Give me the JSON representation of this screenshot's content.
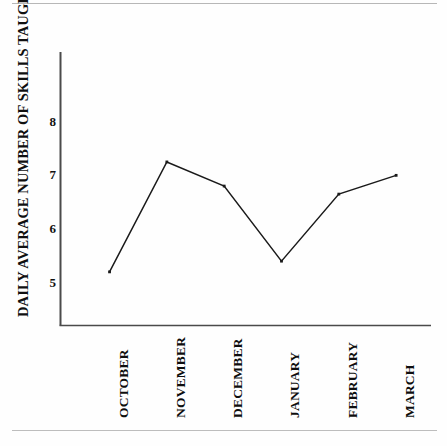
{
  "figure": {
    "name": "line-chart-daily-average-skills-taught",
    "background_color": "#fefefe",
    "line_color": "#1a1a1a",
    "axis_color": "#4a4a4a",
    "rule_color": "#b7b7b7"
  },
  "chart_data": {
    "type": "line",
    "title": "",
    "subtitle": "",
    "xlabel": "",
    "ylabel": "DAILY AVERAGE NUMBER OF SKILLS TAUGHT",
    "categories": [
      "OCTOBER",
      "NOVEMBER",
      "DECEMBER",
      "JANUARY",
      "FEBRUARY",
      "MARCH"
    ],
    "values": [
      5.2,
      7.25,
      6.8,
      5.4,
      6.65,
      7.0
    ],
    "series": [
      {
        "name": "Daily average number of skills taught",
        "values": [
          5.2,
          7.25,
          6.8,
          5.4,
          6.65,
          7.0
        ]
      }
    ],
    "ytick_labels": [
      "8",
      "7",
      "6",
      "5"
    ],
    "ytick_values": [
      8,
      7,
      6,
      5
    ],
    "ylim": [
      4.2,
      9.3
    ],
    "xlim": [
      0,
      6.8
    ],
    "grid": false,
    "legend": false,
    "markers": true,
    "marker_style": "small-square"
  }
}
